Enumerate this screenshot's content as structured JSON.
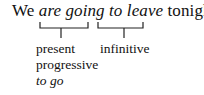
{
  "sentence": {
    "prefix": "We ",
    "phrase1": "are going",
    "space": " ",
    "phrase2": "to leave",
    "suffix": " tonight."
  },
  "labels": {
    "phrase1_line1": "present",
    "phrase1_line2": "progressive",
    "phrase1_line3": "to go",
    "phrase2_line1": "infinitive"
  }
}
